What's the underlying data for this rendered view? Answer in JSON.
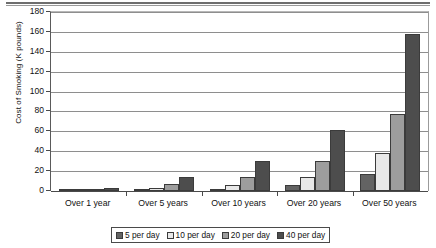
{
  "chart_data": {
    "type": "bar",
    "title": "",
    "xlabel": "",
    "ylabel": "Cost of Smoking (K pounds)",
    "ylim": [
      0,
      180
    ],
    "yticks": [
      0,
      20,
      40,
      60,
      80,
      100,
      120,
      140,
      160,
      180
    ],
    "grid": true,
    "legend_position": "bottom",
    "categories": [
      "Over 1 year",
      "Over 5 years",
      "Over 10 years",
      "Over 20 years",
      "Over 50 years"
    ],
    "series": [
      {
        "name": "5 per day",
        "color": "#636363",
        "values": [
          0.4,
          1.5,
          2.5,
          6,
          17
        ]
      },
      {
        "name": "10 per day",
        "color": "#e8e8e8",
        "values": [
          0.8,
          3,
          6,
          14,
          38
        ]
      },
      {
        "name": "20 per day",
        "color": "#9d9d9d",
        "values": [
          1.6,
          7,
          14,
          30,
          77
        ]
      },
      {
        "name": "40 per day",
        "color": "#4d4d4d",
        "values": [
          3,
          14,
          30.5,
          61,
          157.5
        ]
      }
    ]
  },
  "axis": {
    "y_title": "Cost of Smoking (K pounds)",
    "y_tick_labels": [
      "180",
      "160",
      "140",
      "120",
      "100",
      "80",
      "60",
      "40",
      "20",
      "0"
    ],
    "x_tick_labels": [
      "Over 1 year",
      "Over 5 years",
      "Over 10 years",
      "Over 20 years",
      "Over 50 years"
    ]
  },
  "legend": {
    "items": [
      {
        "label": "5 per day",
        "color": "#636363"
      },
      {
        "label": "10 per day",
        "color": "#e8e8e8"
      },
      {
        "label": "20 per day",
        "color": "#9d9d9d"
      },
      {
        "label": "40 per day",
        "color": "#4d4d4d"
      }
    ]
  }
}
